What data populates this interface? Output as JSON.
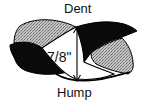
{
  "diagram": {
    "labels": {
      "top": "Dent",
      "bottom": "Hump",
      "measurement": "7/8\""
    },
    "colors": {
      "dark_fill": "#0a0a0a",
      "stipple_fill": "#b8b8b8",
      "stipple_dot": "#6a6a6a",
      "outline": "#000000",
      "background": "#ffffff"
    },
    "arrow": {
      "orientation": "vertical",
      "heads": "both",
      "from_label": "Dent",
      "to_label": "Hump"
    }
  }
}
